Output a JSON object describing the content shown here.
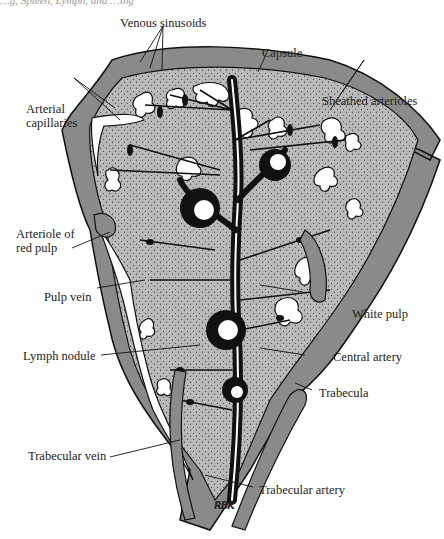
{
  "header_fragment": "…g, Spleen, Lymph, and …ing",
  "figure": {
    "labels": {
      "venous_sinusoids": "Venous sinusoids",
      "capsule": "Capsule",
      "sheathed_arterioles": "Sheathed arterioles",
      "arterial_capillaries_line1": "Arterial",
      "arterial_capillaries_line2": "capillaries",
      "arteriole_red_pulp_line1": "Arteriole of",
      "arteriole_red_pulp_line2": "red pulp",
      "pulp_vein": "Pulp vein",
      "white_pulp": "White pulp",
      "lymph_nodule": "Lymph nodule",
      "central_artery": "Central artery",
      "trabecula": "Trabecula",
      "trabecular_vein": "Trabecular vein",
      "trabecular_artery": "Trabecular artery"
    },
    "signature": "RBK",
    "colors": {
      "capsule_gray": "#8a8a8a",
      "pulp_gray": "#b9b9b9",
      "vessel_black": "#111111",
      "sinus_white": "#ffffff"
    }
  }
}
